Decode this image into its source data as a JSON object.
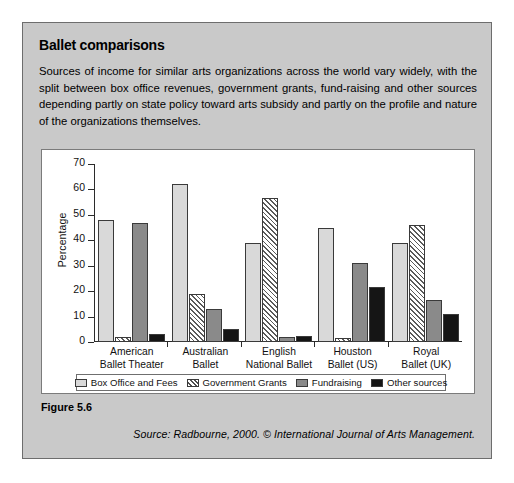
{
  "panel": {
    "title": "Ballet comparisons",
    "intro": "Sources of income for similar arts organizations across the world vary widely, with the split between box office revenues, government grants, fund-raising and other sources depending partly on state policy toward arts subsidy and partly on the profile and nature of the organizations themselves.",
    "figure_label": "Figure 5.6",
    "source": "Source: Radbourne, 2000. © International Journal of Arts Management."
  },
  "chart_data": {
    "type": "bar",
    "title": "",
    "xlabel": "",
    "ylabel": "Percentage",
    "ylim": [
      0,
      70
    ],
    "yticks": [
      0,
      10,
      20,
      30,
      40,
      50,
      60,
      70
    ],
    "ytick_labels": [
      "0",
      "10",
      "20",
      "30",
      "40",
      "50",
      "60",
      "70"
    ],
    "grid": false,
    "legend_position": "bottom",
    "categories": [
      "American\nBallet Theater",
      "Australian\nBallet",
      "English\nNational Ballet",
      "Houston\nBallet (US)",
      "Royal\nBallet (UK)"
    ],
    "category_lines": [
      [
        "American",
        "Ballet Theater"
      ],
      [
        "Australian",
        "Ballet"
      ],
      [
        "English",
        "National Ballet"
      ],
      [
        "Houston",
        "Ballet (US)"
      ],
      [
        "Royal",
        "Ballet (UK)"
      ]
    ],
    "series": [
      {
        "name": "Box Office and Fees",
        "color": "#d9d9d9",
        "pattern": "solid-light",
        "values": [
          48,
          62,
          39,
          45,
          39
        ]
      },
      {
        "name": "Government Grants",
        "color": "#ffffff",
        "pattern": "diagonal-hatch",
        "values": [
          2,
          19,
          56.5,
          1.5,
          46
        ]
      },
      {
        "name": "Fundraising",
        "color": "#8a8a8a",
        "pattern": "solid-grey",
        "values": [
          47,
          13,
          2,
          31,
          16.5
        ]
      },
      {
        "name": "Other sources",
        "color": "#151515",
        "pattern": "solid-black",
        "values": [
          3,
          5,
          2.5,
          21.5,
          11
        ]
      }
    ]
  }
}
